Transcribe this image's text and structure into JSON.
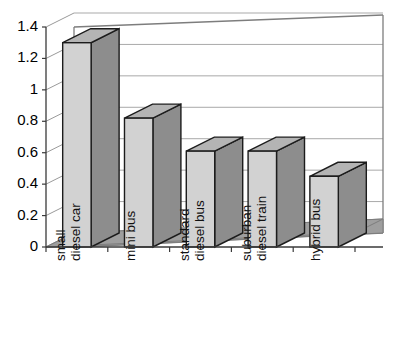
{
  "chart_data": {
    "type": "bar",
    "title": "",
    "subtitle": "",
    "xlabel": "",
    "ylabel": "",
    "categories": [
      "small diesel car",
      "mini bus",
      "standard diesel bus",
      "suburban diesel train",
      "hybrid bus"
    ],
    "category_lines": [
      [
        "small",
        "diesel car"
      ],
      [
        "mini bus"
      ],
      [
        "standard",
        "diesel bus"
      ],
      [
        "suburban",
        "diesel train"
      ],
      [
        "hybrid bus"
      ]
    ],
    "values": [
      1.3,
      0.82,
      0.61,
      0.61,
      0.45
    ],
    "ylim": [
      0,
      1.4
    ],
    "ytick_values": [
      0,
      0.2,
      0.4,
      0.6,
      0.8,
      1,
      1.2,
      1.4
    ],
    "ytick_labels": [
      "0",
      "0.2",
      "0.4",
      "0.6",
      "0.8",
      "1",
      "1.2",
      "1.4"
    ],
    "grid": true,
    "legend": false,
    "legend_position": "none",
    "style": "3d-column",
    "label_rotation": -90
  },
  "colors": {
    "background": "#ffffff",
    "bar_front": "#d2d2d2",
    "bar_side": "#8d8d8d",
    "bar_top": "#b4b4b4",
    "bar_outline": "#1c1c1c",
    "floor": "#9e9e9e",
    "gridline": "#a9a9a9",
    "axis": "#3a3a3a",
    "text": "#000000"
  }
}
